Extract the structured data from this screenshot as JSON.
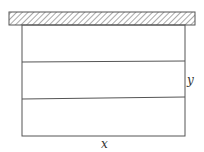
{
  "diagram": {
    "labels": {
      "width": "x",
      "height": "y"
    },
    "ceiling": {
      "style": "hatched"
    },
    "sections": 3,
    "colors": {
      "stroke": "#555555",
      "background": "#ffffff"
    }
  }
}
